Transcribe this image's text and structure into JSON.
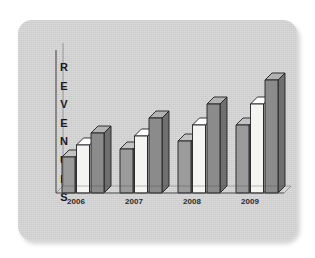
{
  "panel": {
    "background_color": "#d3d3d3",
    "border_radius": 14
  },
  "chart_data": {
    "type": "bar",
    "title": "",
    "subtitle": "",
    "xlabel": "",
    "ylabel": "REVENUES",
    "ylabel_letters": "R\nE\nV\nE\nN\nU\nE\nS",
    "categories": [
      "2006",
      "2007",
      "2008",
      "2009"
    ],
    "series": [
      {
        "name": "Series 1",
        "color": "#9b9b9b",
        "values": [
          36,
          44,
          52,
          68
        ]
      },
      {
        "name": "Series 2",
        "color": "#f4f4f2",
        "values": [
          48,
          57,
          68,
          89
        ]
      },
      {
        "name": "Series 3",
        "color": "#8b8b8b",
        "values": [
          60,
          75,
          89,
          113
        ]
      }
    ],
    "ylim": [
      0,
      120
    ],
    "grid": false,
    "legend": "none",
    "three_d": true,
    "axis_color": "#4a4a4c",
    "tick_label_color": "#2b2b2d"
  },
  "axes": {
    "x_tick_labels": [
      "2006",
      "2007",
      "2008",
      "2009"
    ]
  },
  "bars_px": {
    "baseline_y": 173,
    "bar_width": 13,
    "depth": 7,
    "groups": [
      {
        "label": "2006",
        "x": 44,
        "tops": [
          137,
          125,
          113
        ]
      },
      {
        "label": "2007",
        "x": 102,
        "tops": [
          129,
          116,
          98
        ]
      },
      {
        "label": "2008",
        "x": 160,
        "tops": [
          121,
          105,
          84
        ]
      },
      {
        "label": "2009",
        "x": 218,
        "tops": [
          105,
          84,
          60
        ]
      }
    ]
  },
  "colors": {
    "bar_light": "#9b9b9b",
    "bar_white": "#f4f4f2",
    "bar_dark": "#8b8b8b",
    "top_light": "#c2c2c2",
    "top_white": "#ffffff",
    "top_dark": "#b2b2b2",
    "side_light": "#7d7d7d",
    "side_white": "#cfcfcd",
    "side_dark": "#6f6f6f",
    "outline": "#1f1f21",
    "panel": "#d3d3d3",
    "axis": "#4a4a4c"
  }
}
